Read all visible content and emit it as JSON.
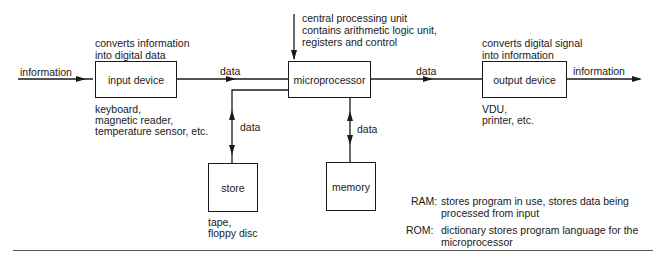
{
  "diagram": {
    "type": "microprocessor-system-block-diagram",
    "blocks": {
      "input_device": {
        "label": "input device",
        "description": [
          "converts information",
          "into digital data"
        ],
        "examples": [
          "keyboard,",
          "magnetic reader,",
          "temperature sensor, etc."
        ]
      },
      "microprocessor": {
        "label": "microprocessor",
        "description": [
          "central processing unit",
          "contains arithmetic logic unit,",
          "registers and control"
        ]
      },
      "output_device": {
        "label": "output device",
        "description": [
          "converts digital signal",
          "into information"
        ],
        "examples": [
          "VDU,",
          "printer, etc."
        ]
      },
      "store": {
        "label": "store",
        "examples": [
          "tape,",
          "floppy disc"
        ]
      },
      "memory": {
        "label": "memory"
      }
    },
    "edges": {
      "in_info": "information",
      "in_to_cpu": "data",
      "cpu_to_out": "data",
      "out_info": "information",
      "cpu_store": "data",
      "cpu_memory": "data"
    },
    "notes": {
      "ram_key": "RAM:",
      "ram_text": [
        "stores program in use, stores data being",
        "processed from input"
      ],
      "rom_key": "ROM:",
      "rom_text": [
        "dictionary stores program language for the",
        "microprocessor"
      ]
    }
  }
}
